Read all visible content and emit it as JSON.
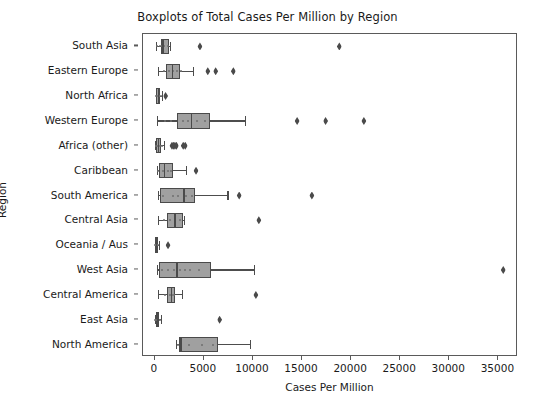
{
  "chart_data": {
    "type": "box",
    "orientation": "horizontal",
    "title": "Boxplots of Total Cases Per Million by Region",
    "xlabel": "Cases Per Million",
    "ylabel": "Region",
    "xlim": [
      -1200,
      37000
    ],
    "xticks": [
      0,
      5000,
      10000,
      15000,
      20000,
      25000,
      30000,
      35000
    ],
    "xticklabels": [
      "0",
      "5000",
      "10000",
      "15000",
      "20000",
      "25000",
      "30000",
      "35000"
    ],
    "grid": false,
    "legend": null,
    "box_facecolor": "#a0a0a0",
    "box_edgecolor": "#4a4a4a",
    "flier_color": "#4a4a4a",
    "flier_marker": "diamond",
    "categories": [
      "South Asia",
      "Eastern Europe",
      "North Africa",
      "Western Europe",
      "Africa (other)",
      "Caribbean",
      "South America",
      "Central Asia",
      "Oceania / Aus",
      "West Asia",
      "Central America",
      "East Asia",
      "North America"
    ],
    "boxes": [
      {
        "category": "South Asia",
        "whisker_low": 120,
        "q1": 620,
        "median": 780,
        "q3": 1450,
        "whisker_high": 1500,
        "fliers": [
          4600,
          18800
        ],
        "points": [
          200,
          500,
          700,
          900,
          1300
        ]
      },
      {
        "category": "Eastern Europe",
        "whisker_low": 350,
        "q1": 1150,
        "median": 1750,
        "q3": 2550,
        "whisker_high": 3900,
        "fliers": [
          5400,
          6200,
          8000
        ],
        "points": [
          900,
          1400,
          1900,
          2300,
          2700
        ]
      },
      {
        "category": "North Africa",
        "whisker_low": 90,
        "q1": 150,
        "median": 330,
        "q3": 520,
        "whisker_high": 700,
        "fliers": [
          1100
        ],
        "points": [
          120,
          300,
          450,
          600
        ]
      },
      {
        "category": "Western Europe",
        "whisker_low": 200,
        "q1": 2300,
        "median": 3700,
        "q3": 5600,
        "whisker_high": 9200,
        "fliers": [
          14500,
          17400,
          21300
        ],
        "points": [
          1000,
          1700,
          2900,
          3400,
          4300,
          5100
        ]
      },
      {
        "category": "Africa (other)",
        "whisker_low": 30,
        "q1": 140,
        "median": 330,
        "q3": 640,
        "whisker_high": 900,
        "fliers": [
          1750,
          1900,
          2050,
          2200,
          2900,
          3100
        ],
        "points": [
          80,
          200,
          350,
          500,
          700
        ]
      },
      {
        "category": "Caribbean",
        "whisker_low": 200,
        "q1": 400,
        "median": 900,
        "q3": 1900,
        "whisker_high": 3150,
        "fliers": [
          4200
        ],
        "points": [
          350,
          800,
          1300,
          1700
        ]
      },
      {
        "category": "South America",
        "whisker_low": 320,
        "q1": 500,
        "median": 2900,
        "q3": 4100,
        "whisker_high": 7400,
        "fliers": [
          8600,
          16000
        ],
        "points": [
          800,
          1900,
          2400,
          3200,
          3800
        ]
      },
      {
        "category": "Central Asia",
        "whisker_low": 280,
        "q1": 1200,
        "median": 2000,
        "q3": 2850,
        "whisker_high": 3000,
        "fliers": [
          10600
        ],
        "points": [
          900,
          1500,
          2100,
          2600
        ]
      },
      {
        "category": "Oceania / Aus",
        "whisker_low": 10,
        "q1": 40,
        "median": 120,
        "q3": 280,
        "whisker_high": 400,
        "fliers": [
          1350
        ],
        "points": [
          30,
          90,
          170,
          250,
          330
        ]
      },
      {
        "category": "West Asia",
        "whisker_low": 180,
        "q1": 420,
        "median": 2200,
        "q3": 5700,
        "whisker_high": 10100,
        "fliers": [
          35500
        ],
        "points": [
          700,
          1300,
          2000,
          2600,
          3100,
          3600,
          4500
        ]
      },
      {
        "category": "Central America",
        "whisker_low": 280,
        "q1": 1200,
        "median": 1650,
        "q3": 2100,
        "whisker_high": 2800,
        "fliers": [
          10300
        ],
        "points": [
          1000,
          1500,
          1800,
          2000
        ]
      },
      {
        "category": "East Asia",
        "whisker_low": 20,
        "q1": 90,
        "median": 250,
        "q3": 470,
        "whisker_high": 650,
        "fliers": [
          6600
        ],
        "points": [
          40,
          150,
          300,
          420,
          560
        ]
      },
      {
        "category": "North America",
        "whisker_low": 2150,
        "q1": 2450,
        "median": 2600,
        "q3": 6450,
        "whisker_high": 9700,
        "fliers": [],
        "points": [
          2400,
          3500,
          4800,
          5900
        ]
      }
    ]
  }
}
